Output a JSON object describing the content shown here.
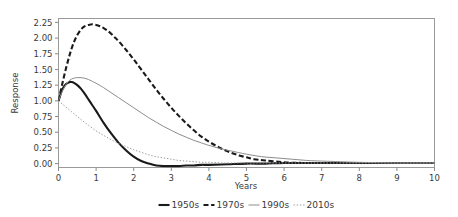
{
  "chart_data": {
    "type": "line",
    "title": "",
    "xlabel": "Years",
    "ylabel": "Response",
    "xlim": [
      0,
      10
    ],
    "ylim": [
      -0.0625,
      2.3125
    ],
    "xticks": [
      "0",
      "1",
      "2",
      "3",
      "4",
      "5",
      "6",
      "7",
      "8",
      "9",
      "10"
    ],
    "xtick_values": [
      0,
      1,
      2,
      3,
      4,
      5,
      6,
      7,
      8,
      9,
      10
    ],
    "yticks": [
      "0.00",
      "0.25",
      "0.50",
      "0.75",
      "1.00",
      "1.25",
      "1.50",
      "1.75",
      "2.00",
      "2.25"
    ],
    "ytick_values": [
      0.0,
      0.25,
      0.5,
      0.75,
      1.0,
      1.25,
      1.5,
      1.75,
      2.0,
      2.25
    ],
    "grid": false,
    "legend_position": "bottom",
    "series": [
      {
        "name": "1950s",
        "style": "solid-thick",
        "color": "#1a1a1a",
        "width": 2.1,
        "dash": "",
        "x": [
          0,
          0.1,
          0.2,
          0.3,
          0.35,
          0.4,
          0.5,
          0.6,
          0.7,
          0.8,
          0.9,
          1.0,
          1.2,
          1.4,
          1.6,
          1.8,
          2.0,
          2.2,
          2.4,
          2.6,
          2.8,
          3.0,
          3.2,
          3.4,
          3.6,
          3.8,
          4.0,
          4.5,
          5.0,
          5.5,
          6.0,
          7.0,
          8.0,
          9.0,
          10.0
        ],
        "y": [
          1.0,
          1.18,
          1.27,
          1.3,
          1.3,
          1.29,
          1.25,
          1.19,
          1.11,
          1.02,
          0.93,
          0.84,
          0.65,
          0.48,
          0.33,
          0.21,
          0.11,
          0.04,
          0.0,
          -0.03,
          -0.04,
          -0.04,
          -0.04,
          -0.03,
          -0.03,
          -0.02,
          -0.02,
          -0.01,
          0.0,
          0.0,
          0.01,
          0.01,
          0.01,
          0.01,
          0.01
        ]
      },
      {
        "name": "1970s",
        "style": "dashed-thick",
        "color": "#1a1a1a",
        "width": 2.1,
        "dash": "5,2.6",
        "x": [
          0,
          0.1,
          0.2,
          0.3,
          0.4,
          0.5,
          0.6,
          0.7,
          0.8,
          0.9,
          1.0,
          1.1,
          1.2,
          1.3,
          1.4,
          1.5,
          1.6,
          1.8,
          2.0,
          2.2,
          2.4,
          2.6,
          2.8,
          3.0,
          3.2,
          3.4,
          3.6,
          3.8,
          4.0,
          4.2,
          4.4,
          4.6,
          4.8,
          5.0,
          5.2,
          5.5,
          6.0,
          6.5,
          7.0,
          8.0,
          9.0,
          10.0
        ],
        "y": [
          1.0,
          1.27,
          1.52,
          1.74,
          1.92,
          2.05,
          2.14,
          2.19,
          2.21,
          2.22,
          2.21,
          2.19,
          2.16,
          2.12,
          2.07,
          2.01,
          1.95,
          1.81,
          1.66,
          1.5,
          1.34,
          1.18,
          1.03,
          0.89,
          0.76,
          0.64,
          0.53,
          0.43,
          0.35,
          0.28,
          0.22,
          0.17,
          0.13,
          0.1,
          0.07,
          0.05,
          0.02,
          0.01,
          0.01,
          0.01,
          0.01,
          0.01
        ]
      },
      {
        "name": "1990s",
        "style": "solid-thin",
        "color": "#8c8c8c",
        "width": 1.0,
        "dash": "",
        "x": [
          0,
          0.1,
          0.2,
          0.3,
          0.4,
          0.5,
          0.6,
          0.7,
          0.8,
          0.9,
          1.0,
          1.2,
          1.4,
          1.6,
          1.8,
          2.0,
          2.2,
          2.4,
          2.6,
          2.8,
          3.0,
          3.2,
          3.4,
          3.6,
          3.8,
          4.0,
          4.3,
          4.6,
          5.0,
          5.4,
          5.8,
          6.2,
          6.6,
          7.0,
          7.5,
          8.0,
          9.0,
          10.0
        ],
        "y": [
          1.0,
          1.15,
          1.26,
          1.33,
          1.36,
          1.37,
          1.37,
          1.36,
          1.34,
          1.31,
          1.28,
          1.21,
          1.13,
          1.05,
          0.97,
          0.89,
          0.81,
          0.73,
          0.66,
          0.59,
          0.53,
          0.47,
          0.42,
          0.37,
          0.33,
          0.29,
          0.24,
          0.2,
          0.15,
          0.11,
          0.09,
          0.07,
          0.05,
          0.04,
          0.03,
          0.02,
          0.01,
          0.01
        ]
      },
      {
        "name": "2010s",
        "style": "dotted-thin",
        "color": "#9a9a9a",
        "width": 1.0,
        "dash": "1.4,1.8",
        "x": [
          0,
          0.1,
          0.2,
          0.3,
          0.4,
          0.5,
          0.6,
          0.8,
          1.0,
          1.2,
          1.4,
          1.6,
          1.8,
          2.0,
          2.2,
          2.4,
          2.6,
          2.8,
          3.0,
          3.2,
          3.4,
          3.6,
          3.8,
          4.0,
          4.4,
          4.8,
          5.2,
          5.6,
          6.0,
          6.5,
          7.0,
          8.0,
          9.0,
          10.0
        ],
        "y": [
          1.0,
          0.95,
          0.9,
          0.85,
          0.8,
          0.75,
          0.7,
          0.61,
          0.52,
          0.45,
          0.38,
          0.32,
          0.27,
          0.22,
          0.18,
          0.14,
          0.11,
          0.09,
          0.07,
          0.05,
          0.04,
          0.03,
          0.02,
          0.02,
          0.01,
          0.01,
          0.01,
          0.01,
          0.01,
          0.01,
          0.01,
          0.01,
          0.01,
          0.01
        ]
      }
    ]
  },
  "legend": {
    "items": [
      {
        "label": "1950s"
      },
      {
        "label": "1970s"
      },
      {
        "label": "1990s"
      },
      {
        "label": "2010s"
      }
    ]
  }
}
